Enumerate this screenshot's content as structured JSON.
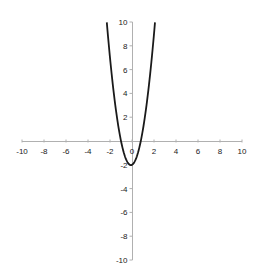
{
  "chart_data": {
    "type": "line",
    "title": "",
    "xlabel": "",
    "ylabel": "",
    "xlim": [
      -10,
      10
    ],
    "ylim": [
      -10,
      10
    ],
    "grid": false,
    "legend": null,
    "x_ticks": [
      -10,
      -8,
      -6,
      -4,
      -2,
      0,
      2,
      4,
      6,
      8,
      10
    ],
    "y_ticks": [
      -10,
      -8,
      -6,
      -4,
      -2,
      2,
      4,
      6,
      8,
      10
    ],
    "x_tick_labels": [
      "-10",
      "-8",
      "-6",
      "-4",
      "-2",
      "0",
      "2",
      "4",
      "6",
      "8",
      "10"
    ],
    "y_tick_labels": [
      "-10",
      "-8",
      "-6",
      "-4",
      "-2",
      "0",
      "2",
      "4",
      "6",
      "8",
      "10"
    ],
    "series": [
      {
        "name": "parabola",
        "description": "upward-opening parabola, approx y = 2.5x^2 + 0.5x - 2",
        "x": [
          -2.29,
          -2.0,
          -1.65,
          -1.5,
          -1.0,
          -0.5,
          -0.1,
          0.0,
          0.5,
          0.8,
          1.0,
          1.45,
          1.5,
          2.0,
          2.09
        ],
        "y": [
          10.0,
          7.0,
          4.0,
          2.9,
          0.0,
          -1.625,
          -2.025,
          -2.0,
          -1.125,
          0.0,
          1.0,
          4.0,
          4.375,
          9.0,
          10.0
        ]
      }
    ],
    "color": "#1a1a1a",
    "axis_color": "#b0b0b0"
  }
}
